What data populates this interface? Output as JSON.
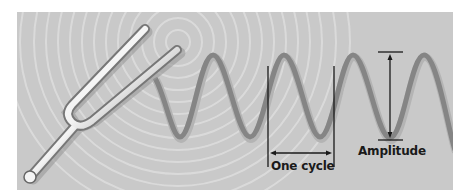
{
  "figure": {
    "labels": {
      "cycle": "One cycle",
      "amplitude": "Amplitude"
    },
    "colors": {
      "background": "#c9c9c9",
      "ripples": "#dcdcdc",
      "wave": "#8a8a8a",
      "fork": "#e8e8e8",
      "annotation": "#1a1a1a"
    }
  }
}
